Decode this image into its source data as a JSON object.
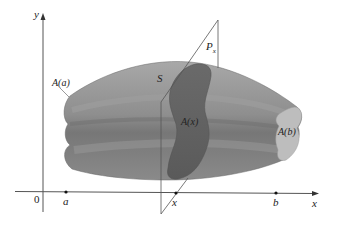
{
  "figure": {
    "type": "solid-cross-section-diagram",
    "labels": {
      "y_axis": "y",
      "x_axis": "x",
      "origin": "0",
      "a": "a",
      "x_point": "x",
      "b": "b",
      "solid": "S",
      "plane": "P",
      "plane_subscript": "x",
      "area_a": "A(a)",
      "area_x": "A(x)",
      "area_b": "A(b)"
    },
    "colors": {
      "background": "#ffffff",
      "axis": "#555555",
      "solid_light": "#a3a3a3",
      "solid_mid": "#8c8c8c",
      "solid_dark": "#6e6e6e",
      "cross_section": "#5f5f5f",
      "end_face": "#bdbdbd",
      "plane_edge": "#555555"
    }
  }
}
